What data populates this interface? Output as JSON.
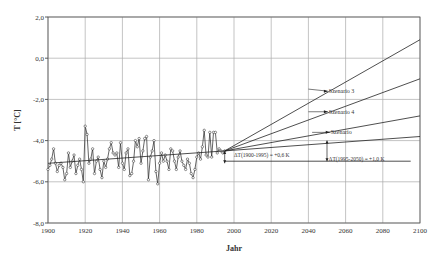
{
  "chart_data": {
    "type": "line",
    "title": "",
    "xlabel": "Jahr",
    "ylabel": "T [°C]",
    "xlim": [
      1900,
      2100
    ],
    "ylim": [
      -8.0,
      2.0
    ],
    "grid": true,
    "legend": null,
    "x_ticks": [
      "1900",
      "1920",
      "1940",
      "1960",
      "1980",
      "2000",
      "2020",
      "2040",
      "2060",
      "2080",
      "2100"
    ],
    "y_ticks": [
      "2,0",
      "0,0",
      "-2,0",
      "-4,0",
      "-6,0",
      "-8,0"
    ],
    "series": [
      {
        "name": "Observed annual mean temperature",
        "style": "line-markers",
        "x": [
          1900,
          1901,
          1902,
          1903,
          1904,
          1905,
          1906,
          1907,
          1908,
          1909,
          1910,
          1911,
          1912,
          1913,
          1914,
          1915,
          1916,
          1917,
          1918,
          1919,
          1920,
          1921,
          1922,
          1923,
          1924,
          1925,
          1926,
          1927,
          1928,
          1929,
          1930,
          1931,
          1932,
          1933,
          1934,
          1935,
          1936,
          1937,
          1938,
          1939,
          1940,
          1941,
          1942,
          1943,
          1944,
          1945,
          1946,
          1947,
          1948,
          1949,
          1950,
          1951,
          1952,
          1953,
          1954,
          1955,
          1956,
          1957,
          1958,
          1959,
          1960,
          1961,
          1962,
          1963,
          1964,
          1965,
          1966,
          1967,
          1968,
          1969,
          1970,
          1971,
          1972,
          1973,
          1974,
          1975,
          1976,
          1977,
          1978,
          1979,
          1980,
          1981,
          1982,
          1983,
          1984,
          1985,
          1986,
          1987,
          1988,
          1989,
          1990,
          1991,
          1992,
          1993,
          1994,
          1995
        ],
        "values": [
          -5.4,
          -5.2,
          -4.9,
          -4.4,
          -5.1,
          -5.5,
          -5.2,
          -5.1,
          -5.3,
          -5.9,
          -5.6,
          -4.6,
          -5.3,
          -5.0,
          -4.7,
          -5.6,
          -5.2,
          -4.9,
          -5.4,
          -6.0,
          -3.3,
          -3.7,
          -5.1,
          -4.9,
          -4.4,
          -5.6,
          -5.0,
          -4.8,
          -5.4,
          -5.8,
          -5.0,
          -5.3,
          -4.9,
          -4.4,
          -4.1,
          -4.6,
          -4.7,
          -4.6,
          -5.3,
          -4.1,
          -5.1,
          -5.4,
          -4.6,
          -4.4,
          -5.7,
          -5.6,
          -5.0,
          -4.0,
          -4.3,
          -3.9,
          -5.1,
          -4.5,
          -3.9,
          -3.8,
          -5.9,
          -4.8,
          -4.5,
          -4.0,
          -5.5,
          -6.1,
          -5.1,
          -4.6,
          -5.0,
          -4.7,
          -5.0,
          -5.4,
          -4.4,
          -4.5,
          -5.0,
          -5.4,
          -4.8,
          -4.5,
          -5.0,
          -5.2,
          -5.4,
          -4.9,
          -5.1,
          -5.6,
          -5.8,
          -5.4,
          -4.8,
          -4.6,
          -4.9,
          -4.3,
          -3.5,
          -4.7,
          -4.8,
          -3.6,
          -4.8,
          -3.6,
          -3.6,
          -4.6,
          -4.4,
          -4.5,
          -4.6,
          -4.5
        ]
      },
      {
        "name": "Trend 1900-1995",
        "style": "line",
        "x": [
          1900,
          1995
        ],
        "values": [
          -5.1,
          -4.5
        ]
      },
      {
        "name": "Scenario 3",
        "style": "line",
        "x": [
          1995,
          2100
        ],
        "values": [
          -4.5,
          0.9
        ]
      },
      {
        "name": "Scenario 4",
        "style": "line",
        "x": [
          1995,
          2100
        ],
        "values": [
          -4.5,
          -1.0
        ]
      },
      {
        "name": "Scenario",
        "style": "line",
        "x": [
          1995,
          2100
        ],
        "values": [
          -4.5,
          -2.8
        ]
      },
      {
        "name": "Baseline trend extension",
        "style": "line",
        "x": [
          1995,
          2100
        ],
        "values": [
          -4.5,
          -3.8
        ]
      },
      {
        "name": "Reference level",
        "style": "line",
        "x": [
          1995,
          2095
        ],
        "values": [
          -5.0,
          -5.0
        ]
      }
    ],
    "annotations": [
      {
        "text": "Szenario 3",
        "x": 2051,
        "y": -1.6,
        "arrow_to": [
          2040,
          -1.5
        ]
      },
      {
        "text": "Szenario 4",
        "x": 2051,
        "y": -2.6,
        "arrow_to": [
          2040,
          -2.6
        ]
      },
      {
        "text": "Szenario",
        "x": 2052,
        "y": -3.6,
        "arrow_to": [
          2042,
          -3.6
        ]
      },
      {
        "text": "ΔT(1900-1995) = +0,6 K",
        "x": 2000,
        "y": -4.7
      },
      {
        "text": "ΔT(1995-2050) = +1,0 K",
        "x": 2051,
        "y": -4.9
      }
    ]
  }
}
